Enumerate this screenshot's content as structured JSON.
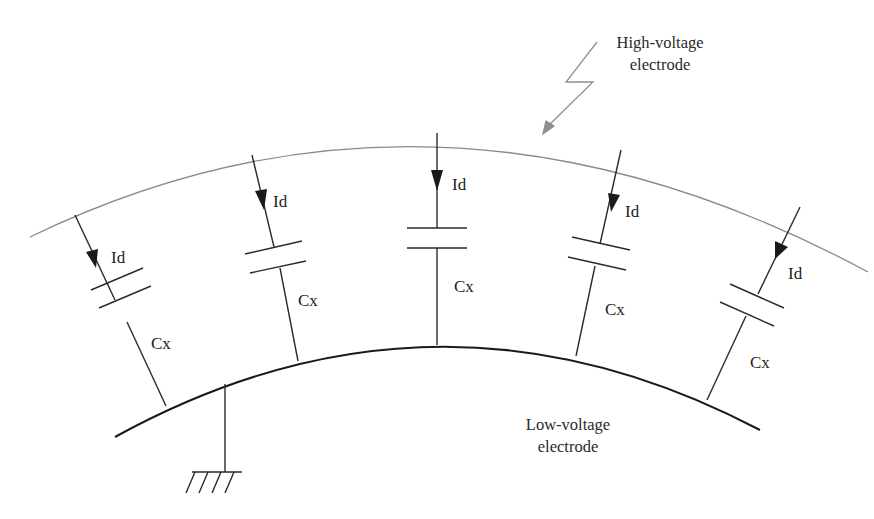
{
  "labels": {
    "high_voltage_line1": "High-voltage",
    "high_voltage_line2": "electrode",
    "low_voltage_line1": "Low-voltage",
    "low_voltage_line2": "electrode"
  },
  "branches": [
    {
      "current_label": "Id",
      "capacitor_label": "Cx"
    },
    {
      "current_label": "Id",
      "capacitor_label": "Cx"
    },
    {
      "current_label": "Id",
      "capacitor_label": "Cx"
    },
    {
      "current_label": "Id",
      "capacitor_label": "Cx"
    },
    {
      "current_label": "Id",
      "capacitor_label": "Cx"
    }
  ],
  "colors": {
    "high_voltage_electrode": "#8a8a8a",
    "low_voltage_electrode": "#1a1a1a",
    "wire": "#2a2a2a",
    "lightning": "#8f8f8f",
    "text": "#222222"
  },
  "symbols": [
    "lightning-icon",
    "ground-icon",
    "arrow-down-icon",
    "capacitor-icon"
  ]
}
